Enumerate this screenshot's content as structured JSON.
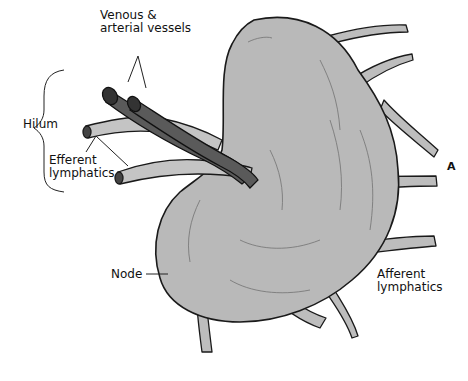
{
  "figure": {
    "panel_letter": "A",
    "colors": {
      "node_fill": "#b9b9b9",
      "vessel_fill": "#5a5a5a",
      "lymphatic_fill": "#bdbdbd",
      "outline": "#1a1a1a",
      "background": "#ffffff"
    }
  },
  "labels": {
    "vessels_line1": "Venous &",
    "vessels_line2": "arterial vessels",
    "hilum": "Hilum",
    "efferent_line1": "Efferent",
    "efferent_line2": "lymphatics",
    "node": "Node",
    "afferent_line1": "Afferent",
    "afferent_line2": "lymphatics"
  }
}
